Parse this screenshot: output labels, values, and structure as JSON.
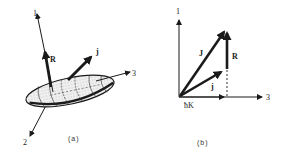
{
  "figure": {
    "panel_a": {
      "caption": "(a)",
      "axes": {
        "axis1": "1",
        "axis2": "2",
        "axis3": "3"
      },
      "vectors": {
        "R": "R",
        "j": "j"
      },
      "body": "deformed-nucleus-ellipsoid"
    },
    "panel_b": {
      "caption": "(b)",
      "axes": {
        "vertical": "1",
        "horizontal": "3"
      },
      "vectors": {
        "J": "J",
        "j": "j",
        "R": "R",
        "hK": "ħK"
      }
    },
    "colors": {
      "ink": "#1a1a1a",
      "background": "#ffffff",
      "shading": "#d8d8d8"
    }
  }
}
